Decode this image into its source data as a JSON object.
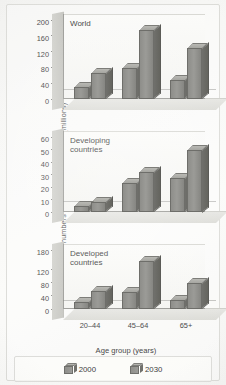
{
  "chart_data": {
    "type": "bar",
    "xlabel": "Age group (years)",
    "ylabel": "Estimated numbers of people with diabetes (millions)",
    "categories": [
      "20–44",
      "45–64",
      "65+"
    ],
    "legend": [
      "2000",
      "2030"
    ],
    "legend_position": "bottom",
    "grid": false,
    "panels": [
      {
        "title": "World",
        "ylim": [
          0,
          200
        ],
        "yticks": [
          0,
          40,
          80,
          120,
          160,
          200
        ],
        "series": [
          {
            "name": "2000",
            "values": [
              30,
              78,
              48
            ]
          },
          {
            "name": "2030",
            "values": [
              65,
              175,
              130
            ]
          }
        ]
      },
      {
        "title": "Developing\ncountries",
        "ylim": [
          0,
          60
        ],
        "yticks": [
          0,
          10,
          20,
          30,
          40,
          50,
          60
        ],
        "series": [
          {
            "name": "2000",
            "values": [
              5,
              23,
              27
            ]
          },
          {
            "name": "2030",
            "values": [
              8,
              32,
              50
            ]
          }
        ]
      },
      {
        "title": "Developed\ncountries",
        "ylim": [
          0,
          180
        ],
        "yticks": [
          0,
          40,
          80,
          120,
          180
        ],
        "series": [
          {
            "name": "2000",
            "values": [
              22,
              53,
              27
            ]
          },
          {
            "name": "2030",
            "values": [
              55,
              145,
              80
            ]
          }
        ]
      }
    ]
  },
  "colors": {
    "bar_face": "#93938f",
    "bar_side": "#6b6b67",
    "bar_top": "#b0b0ab",
    "wall": "#cbcbc6",
    "plot_bg": "#f8f8f6",
    "axis": "#9a9a96",
    "text": "#3b3b3b",
    "page_bg": "#f4f4f2"
  }
}
